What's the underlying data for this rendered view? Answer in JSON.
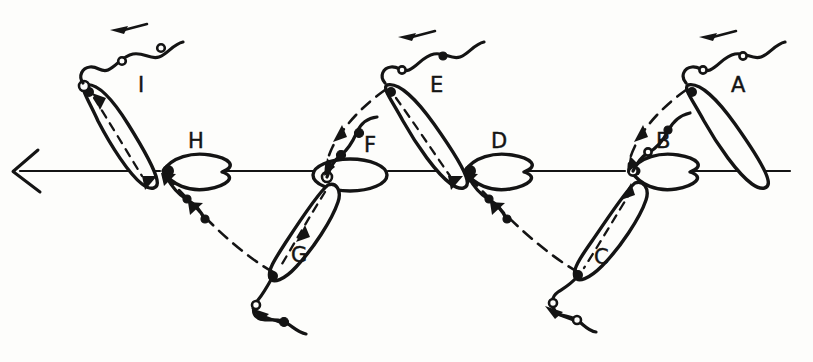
{
  "figure": {
    "background_color": "#fdfdfb",
    "ink_color": "#141414",
    "width": 813,
    "height": 362
  },
  "axis": {
    "name": "swimming-axis",
    "direction": "left",
    "y": 171,
    "x_start": 790,
    "x_end": 12,
    "arrowhead_tip_x": 12,
    "arrowhead_tip_y": 171
  },
  "labels": [
    {
      "id": "A",
      "text": "A",
      "x": 731,
      "y": 92,
      "position": "above-axis"
    },
    {
      "id": "B",
      "text": "B",
      "x": 656,
      "y": 148,
      "position": "on-axis"
    },
    {
      "id": "C",
      "text": "C",
      "x": 594,
      "y": 264,
      "position": "below-axis"
    },
    {
      "id": "D",
      "text": "D",
      "x": 491,
      "y": 148,
      "position": "on-axis"
    },
    {
      "id": "E",
      "text": "E",
      "x": 430,
      "y": 92,
      "position": "above-axis"
    },
    {
      "id": "F",
      "text": "F",
      "x": 364,
      "y": 152,
      "position": "on-axis"
    },
    {
      "id": "G",
      "text": "G",
      "x": 291,
      "y": 262,
      "position": "below-axis"
    },
    {
      "id": "H",
      "text": "H",
      "x": 188,
      "y": 148,
      "position": "on-axis"
    },
    {
      "id": "I",
      "text": "I",
      "x": 138,
      "y": 92,
      "position": "above-axis"
    }
  ],
  "stages": [
    {
      "id": "A",
      "body_shape": "elongated-lens",
      "tilt_deg": 62,
      "side": "above",
      "has_flagellum": true,
      "has_dashed_trajectory": false
    },
    {
      "id": "B",
      "body_shape": "teardrop",
      "tilt_deg": 0,
      "side": "on-axis",
      "has_flagellum": true,
      "has_dashed_trajectory": true
    },
    {
      "id": "C",
      "body_shape": "elongated-lens",
      "tilt_deg": 115,
      "side": "below",
      "has_flagellum": true,
      "has_dashed_trajectory": true
    },
    {
      "id": "D",
      "body_shape": "teardrop",
      "tilt_deg": 0,
      "side": "on-axis",
      "has_flagellum": true,
      "has_dashed_trajectory": true
    },
    {
      "id": "E",
      "body_shape": "elongated-lens",
      "tilt_deg": 62,
      "side": "above",
      "has_flagellum": true,
      "has_dashed_trajectory": true
    },
    {
      "id": "F",
      "body_shape": "ellipse",
      "tilt_deg": 0,
      "side": "on-axis",
      "has_flagellum": true,
      "has_dashed_trajectory": true
    },
    {
      "id": "G",
      "body_shape": "elongated-lens",
      "tilt_deg": 115,
      "side": "below",
      "has_flagellum": true,
      "has_dashed_trajectory": true
    },
    {
      "id": "H",
      "body_shape": "teardrop",
      "tilt_deg": 0,
      "side": "on-axis",
      "has_flagellum": true,
      "has_dashed_trajectory": true
    },
    {
      "id": "I",
      "body_shape": "elongated-lens",
      "tilt_deg": 62,
      "side": "above",
      "has_flagellum": true,
      "has_dashed_trajectory": true
    }
  ],
  "annotations": {
    "flagellum_direction_arrows": 6,
    "trajectory_arrow_count": 12,
    "bead_marker_description": "small circles along flagellum"
  }
}
